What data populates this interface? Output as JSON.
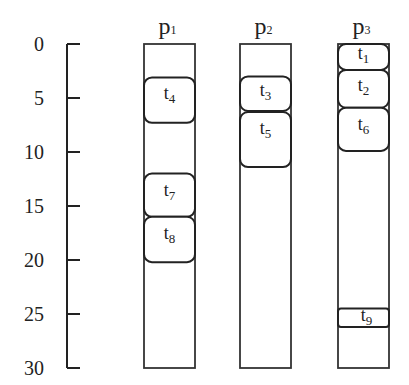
{
  "diagram": {
    "type": "schedule",
    "time_axis": {
      "min": 0,
      "max": 30,
      "ticks": [
        0,
        5,
        10,
        15,
        20,
        25,
        30
      ]
    },
    "processors": [
      {
        "name": "p",
        "sub": "1",
        "tasks": [
          {
            "name": "t",
            "sub": "4",
            "start": 3.1,
            "end": 7.3
          },
          {
            "name": "t",
            "sub": "7",
            "start": 12,
            "end": 16
          },
          {
            "name": "t",
            "sub": "8",
            "start": 16,
            "end": 20.2
          }
        ]
      },
      {
        "name": "p",
        "sub": "2",
        "tasks": [
          {
            "name": "t",
            "sub": "3",
            "start": 3,
            "end": 6.2
          },
          {
            "name": "t",
            "sub": "5",
            "start": 6.3,
            "end": 11.4
          }
        ]
      },
      {
        "name": "p",
        "sub": "3",
        "tasks": [
          {
            "name": "t",
            "sub": "1",
            "start": 0,
            "end": 2.4
          },
          {
            "name": "t",
            "sub": "2",
            "start": 2.4,
            "end": 5.9
          },
          {
            "name": "t",
            "sub": "6",
            "start": 5.9,
            "end": 9.9
          },
          {
            "name": "t",
            "sub": "9",
            "start": 24.5,
            "end": 26.2
          }
        ]
      }
    ]
  }
}
